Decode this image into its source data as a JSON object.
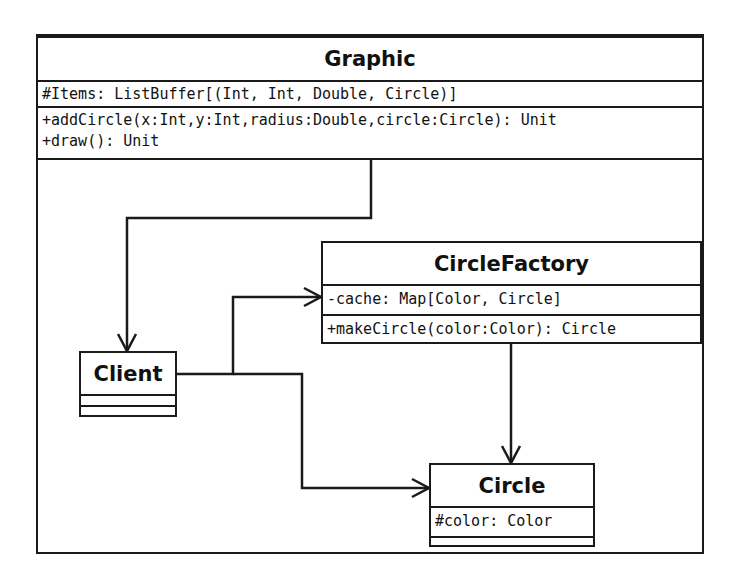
{
  "diagram": {
    "type": "uml-class-diagram",
    "classes": {
      "graphic": {
        "name": "Graphic",
        "attributes": [
          "#Items: ListBuffer[(Int, Int, Double, Circle)]"
        ],
        "operations": [
          "+addCircle(x:Int,y:Int,radius:Double,circle:Circle): Unit",
          "+draw(): Unit"
        ]
      },
      "circle_factory": {
        "name": "CircleFactory",
        "attributes": [
          "-cache: Map[Color, Circle]"
        ],
        "operations": [
          "+makeCircle(color:Color): Circle"
        ]
      },
      "client": {
        "name": "Client",
        "attributes": [],
        "operations": []
      },
      "circle": {
        "name": "Circle",
        "attributes": [
          "#color: Color"
        ],
        "operations": []
      }
    },
    "associations": [
      {
        "from": "Graphic",
        "to": "Client",
        "type": "directed-association"
      },
      {
        "from": "Client",
        "to": "CircleFactory",
        "type": "directed-association"
      },
      {
        "from": "Client",
        "to": "Circle",
        "type": "directed-association"
      },
      {
        "from": "CircleFactory",
        "to": "Circle",
        "type": "directed-association"
      }
    ],
    "colors": {
      "line": "#1a1a1a",
      "background": "#ffffff"
    }
  }
}
